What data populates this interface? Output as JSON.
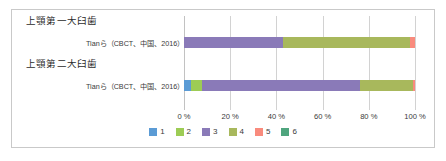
{
  "chart_data": {
    "type": "bar",
    "orientation": "horizontal",
    "stacked": true,
    "percent": true,
    "title": "",
    "xlabel": "",
    "ylabel": "",
    "xlim": [
      0,
      100
    ],
    "grid": true,
    "legend_position": "bottom",
    "xticks": [
      "0 %",
      "20 %",
      "40 %",
      "60 %",
      "80 %",
      "100 %"
    ],
    "xtick_values": [
      0,
      20,
      40,
      60,
      80,
      100
    ],
    "legend": [
      {
        "label": "1",
        "color": "#5b9bd5"
      },
      {
        "label": "2",
        "color": "#9dcc55"
      },
      {
        "label": "3",
        "color": "#8a7ab8"
      },
      {
        "label": "4",
        "color": "#a8b85c"
      },
      {
        "label": "5",
        "color": "#f98b7d"
      },
      {
        "label": "6",
        "color": "#4fa57e"
      }
    ],
    "groups": [
      {
        "title": "上顎第一大臼歯",
        "rows": [
          {
            "label": "Tianら（CBCT、中国、2016）",
            "superscript": "2",
            "values": [
              0,
              0,
              43,
              55,
              2,
              0
            ]
          }
        ]
      },
      {
        "title": "上顎第二大臼歯",
        "rows": [
          {
            "label": "Tianら（CBCT、中国、2016）",
            "superscript": "2",
            "values": [
              3,
              5,
              68,
              23,
              1,
              0
            ]
          }
        ]
      }
    ]
  },
  "colors": {
    "frame_border": "#c9c9c9",
    "gridline": "#d2d2d2",
    "axis": "#c2c2c2",
    "text": "#3a3a3a",
    "title_text": "#2b2b2b",
    "background": "#ffffff"
  }
}
